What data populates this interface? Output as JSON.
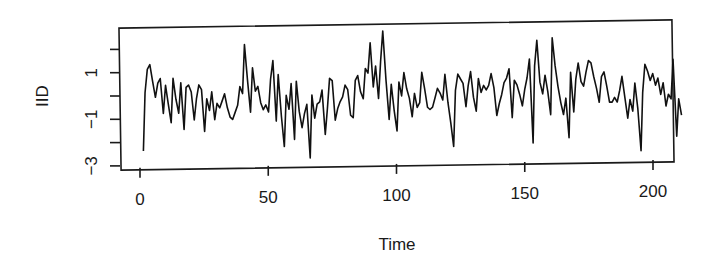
{
  "chart_data": {
    "type": "line",
    "title": "",
    "xlabel": "Time",
    "ylabel": "IID",
    "xlim": [
      0,
      200
    ],
    "ylim": [
      -3,
      2.8
    ],
    "x_ticks": [
      0,
      50,
      100,
      150,
      200
    ],
    "x_tick_labels": [
      "0",
      "50",
      "100",
      "150",
      "200"
    ],
    "y_ticks": [
      -3,
      -2,
      -1,
      0,
      1,
      2
    ],
    "y_tick_labels": [
      "-3",
      "",
      "-1",
      "",
      "1",
      ""
    ],
    "grid": false,
    "legend": null,
    "series": [
      {
        "name": "IID",
        "color": "#111111",
        "x_start": 1,
        "x_step": 1,
        "values": [
          -2.2,
          0.3,
          1.3,
          1.5,
          0.8,
          0.1,
          0.7,
          0.9,
          -0.6,
          0.6,
          -0.2,
          -1.0,
          0.9,
          0.0,
          -0.6,
          0.7,
          -1.3,
          0.5,
          0.6,
          0.3,
          -0.9,
          0.0,
          0.6,
          0.4,
          -1.4,
          0.0,
          -0.5,
          0.3,
          -0.9,
          -0.2,
          -0.4,
          -0.1,
          0.2,
          -0.4,
          -0.8,
          -0.9,
          -0.6,
          -0.3,
          0.5,
          0.2,
          2.3,
          0.8,
          -0.6,
          1.3,
          0.3,
          0.5,
          -0.2,
          -0.5,
          -0.3,
          -0.6,
          0.8,
          1.6,
          -1.0,
          1.0,
          -0.8,
          -2.1,
          0.1,
          -0.5,
          0.6,
          -1.8,
          0.7,
          -0.6,
          -1.3,
          -0.7,
          -0.3,
          -2.6,
          0.1,
          -0.9,
          -0.3,
          -0.2,
          0.3,
          -1.6,
          -0.5,
          0.8,
          0.7,
          -1.0,
          -0.5,
          -0.2,
          0.0,
          0.5,
          0.3,
          -0.8,
          -0.9,
          0.7,
          0.9,
          0.2,
          -0.1,
          1.2,
          1.0,
          2.3,
          0.4,
          1.3,
          -0.1,
          1.5,
          2.8,
          0.7,
          -1.0,
          0.5,
          -0.6,
          -1.5,
          0.6,
          0.0,
          1.0,
          0.3,
          -0.1,
          -0.9,
          0.1,
          -0.5,
          -0.3,
          1.0,
          0.3,
          -0.5,
          -0.6,
          -0.5,
          -0.1,
          0.3,
          0.1,
          -0.2,
          0.9,
          -0.3,
          -1.2,
          -2.2,
          0.2,
          0.9,
          0.7,
          0.5,
          -0.5,
          0.4,
          1.0,
          -0.1,
          -0.7,
          0.7,
          0.1,
          0.4,
          0.2,
          0.4,
          0.9,
          0.3,
          -0.9,
          -0.4,
          0.0,
          0.5,
          0.7,
          1.1,
          -1.0,
          0.6,
          0.4,
          0.0,
          -0.5,
          0.2,
          0.7,
          1.5,
          -2.1,
          1.2,
          2.3,
          0.5,
          0.0,
          0.8,
          0.1,
          -0.9,
          2.4,
          1.2,
          0.3,
          -0.4,
          -0.9,
          -0.2,
          -1.9,
          0.9,
          -0.8,
          0.6,
          1.3,
          0.5,
          0.3,
          0.9,
          1.4,
          1.3,
          0.7,
          0.2,
          -0.4,
          0.7,
          0.9,
          0.3,
          -0.4,
          -0.4,
          -0.2,
          -0.4,
          0.1,
          0.7,
          -0.2,
          -1.1,
          -0.3,
          -0.8,
          0.4,
          -0.7,
          -2.5,
          0.0,
          1.2,
          0.9,
          0.5,
          0.8,
          0.3,
          0.6,
          -0.1,
          0.4,
          -0.6,
          -0.1,
          -0.3,
          1.4,
          -1.9,
          -0.3,
          -1.0
        ]
      }
    ]
  }
}
